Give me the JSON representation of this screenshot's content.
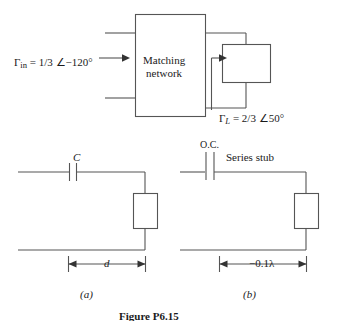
{
  "figure": {
    "caption": "Figure P6.15",
    "panels": [
      {
        "key": "a",
        "label": "(a)"
      },
      {
        "key": "b",
        "label": "(b)"
      }
    ]
  },
  "top_diagram": {
    "block_label_line1": "Matching",
    "block_label_line2": "network",
    "gamma_in": {
      "symbol": "Γ",
      "subscript": "in",
      "equals": " = 1/3 ",
      "angle_symbol": "∠",
      "value": "−120°",
      "full": "Γin = 1/3 ∠−120°"
    },
    "gamma_load": {
      "symbol": "Γ",
      "subscript": "L",
      "equals": " = 2/3 ",
      "angle_symbol": "∠",
      "value": "50°",
      "full": "ΓL = 2/3 ∠50°"
    }
  },
  "panel_a": {
    "component_label": "C",
    "component_type": "series-capacitor",
    "dimension_label": "d"
  },
  "panel_b": {
    "termination_label": "O.C.",
    "component_label": "Series stub",
    "component_type": "series-stub",
    "dimension_label": "−0.1λ"
  },
  "colors": {
    "line": "#555555",
    "text": "#1a1a1a",
    "background": "#ffffff"
  }
}
